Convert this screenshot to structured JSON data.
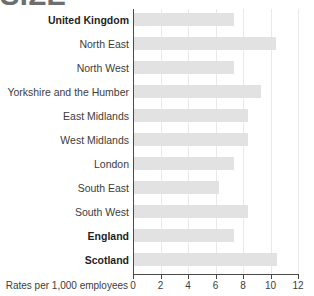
{
  "title": {
    "text": "SIZE",
    "note": "clipped at top edge of screenshot"
  },
  "axis": {
    "caption": "Rates per 1,000 employees",
    "ticks": [
      0,
      2,
      4,
      6,
      8,
      10,
      12
    ]
  },
  "chart_data": {
    "type": "bar",
    "orientation": "horizontal",
    "title": "SIZE",
    "xlabel": "Rates per 1,000 employees",
    "ylabel": "",
    "xlim": [
      0,
      12
    ],
    "xticks": [
      0,
      2,
      4,
      6,
      8,
      10,
      12
    ],
    "grid": true,
    "legend": null,
    "bar_color": "#e2e2e2",
    "categories": [
      "United Kingdom",
      "North East",
      "North West",
      "Yorkshire and the Humber",
      "East Midlands",
      "West Midlands",
      "London",
      "South East",
      "South West",
      "England",
      "Scotland"
    ],
    "values": [
      7.3,
      10.3,
      7.3,
      9.2,
      8.3,
      8.3,
      7.3,
      6.2,
      8.3,
      7.3,
      10.4
    ],
    "emphasised_categories": [
      "United Kingdom",
      "England",
      "Scotland"
    ]
  }
}
